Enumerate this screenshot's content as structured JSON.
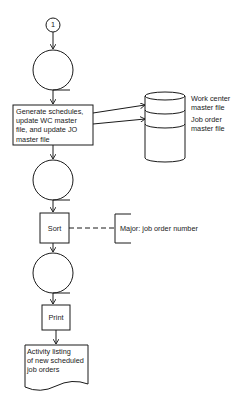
{
  "diagram": {
    "type": "flowchart",
    "connector": {
      "label": "1"
    },
    "process_update": {
      "label": "Generate schedules, update WC master file, and update JO master file",
      "lines": [
        "Generate schedules,",
        "update WC master",
        "file, and update JO",
        "master file"
      ]
    },
    "storage": {
      "files": [
        {
          "label_lines": [
            "Work center",
            "master file"
          ]
        },
        {
          "label_lines": [
            "Job order",
            "master file"
          ]
        }
      ]
    },
    "sort": {
      "label": "Sort"
    },
    "sort_annotation": {
      "label": "Major: job order number"
    },
    "print": {
      "label": "Print"
    },
    "output_document": {
      "lines": [
        "Activity listing",
        "of new scheduled",
        "job orders"
      ]
    },
    "colors": {
      "stroke": "#1a1a1a",
      "background": "#ffffff"
    }
  }
}
